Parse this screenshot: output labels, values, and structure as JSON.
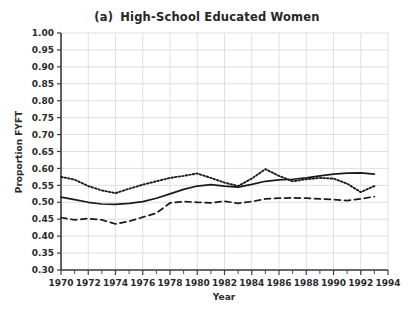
{
  "chart_data": {
    "type": "line",
    "panel_tag": "(a)",
    "title_text": "High-School Educated Women",
    "xlabel": "Year",
    "ylabel": "Proportion FYFT",
    "xlim": [
      1970,
      1994
    ],
    "ylim": [
      0.3,
      1.0
    ],
    "grid": true,
    "legend_position": "none",
    "x_tick_labels": [
      "1970",
      "1972",
      "1974",
      "1976",
      "1978",
      "1980",
      "1982",
      "1984",
      "1986",
      "1988",
      "1990",
      "1992",
      "1994"
    ],
    "x_tick_values": [
      1970,
      1972,
      1974,
      1976,
      1978,
      1980,
      1982,
      1984,
      1986,
      1988,
      1990,
      1992,
      1994
    ],
    "x_minor_tick_values": [
      1971,
      1973,
      1975,
      1977,
      1979,
      1981,
      1983,
      1985,
      1987,
      1989,
      1991,
      1993
    ],
    "y_tick_labels": [
      "1.00",
      "0.95",
      "0.90",
      "0.85",
      "0.80",
      "0.75",
      "0.70",
      "0.65",
      "0.60",
      "0.55",
      "0.50",
      "0.45",
      "0.40",
      "0.35",
      "0.30"
    ],
    "y_tick_values": [
      1.0,
      0.95,
      0.9,
      0.85,
      0.8,
      0.75,
      0.7,
      0.65,
      0.6,
      0.55,
      0.5,
      0.45,
      0.4,
      0.35,
      0.3
    ],
    "x": [
      1970,
      1971,
      1972,
      1973,
      1974,
      1975,
      1976,
      1977,
      1978,
      1979,
      1980,
      1981,
      1982,
      1983,
      1984,
      1985,
      1986,
      1987,
      1988,
      1989,
      1990,
      1991,
      1992,
      1993
    ],
    "series": [
      {
        "name": "dotted-series",
        "style": "dotted",
        "color": "#1a1a1a",
        "values": [
          0.575,
          0.567,
          0.548,
          0.535,
          0.527,
          0.54,
          0.552,
          0.562,
          0.572,
          0.578,
          0.585,
          0.572,
          0.558,
          0.548,
          0.57,
          0.598,
          0.578,
          0.562,
          0.568,
          0.572,
          0.57,
          0.555,
          0.53,
          0.548
        ]
      },
      {
        "name": "solid-series",
        "style": "solid",
        "color": "#1a1a1a",
        "values": [
          0.515,
          0.508,
          0.5,
          0.495,
          0.494,
          0.497,
          0.502,
          0.512,
          0.525,
          0.538,
          0.548,
          0.552,
          0.548,
          0.545,
          0.553,
          0.562,
          0.566,
          0.568,
          0.572,
          0.578,
          0.583,
          0.586,
          0.587,
          0.583
        ]
      },
      {
        "name": "dashed-series",
        "style": "dashed",
        "color": "#1a1a1a",
        "values": [
          0.455,
          0.448,
          0.452,
          0.448,
          0.436,
          0.444,
          0.456,
          0.468,
          0.498,
          0.502,
          0.5,
          0.498,
          0.503,
          0.497,
          0.502,
          0.51,
          0.512,
          0.513,
          0.512,
          0.51,
          0.508,
          0.505,
          0.51,
          0.517
        ]
      }
    ]
  }
}
